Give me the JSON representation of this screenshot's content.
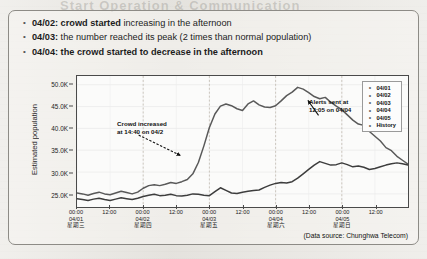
{
  "ghost_text": "Start Operation & Communication",
  "bullets": [
    {
      "marker": "•",
      "bold_part": "04/02: crowd started ",
      "normal_part": "increasing in the afternoon"
    },
    {
      "marker": "•",
      "bold_part": "04/03: ",
      "normal_part": " the number reached its peak (2 times than normal population)"
    },
    {
      "marker": "•",
      "bold_part": "04/04: the crowd started to decrease in the afternoon",
      "normal_part": ""
    }
  ],
  "source_note": "(Data source: Chunghwa Telecom)",
  "annotations": {
    "left": {
      "line1": "Crowd increased",
      "line2": "at 14:40 on 04/2"
    },
    "right": {
      "line1": "Alerts sent at",
      "line2": "12:05 on 04/04"
    }
  },
  "legend": {
    "marker": "•",
    "items": [
      "04/01",
      "04/02",
      "04/03",
      "04/04",
      "04/05",
      "History"
    ]
  },
  "chart_data": {
    "type": "line",
    "title": "",
    "xlabel": "",
    "ylabel": "Estimated population",
    "ylim": [
      22000,
      52000
    ],
    "ytick_values": [
      25000,
      30000,
      35000,
      40000,
      45000,
      50000
    ],
    "ytick_labels": [
      "25.0K",
      "30.0K",
      "35.0K",
      "40.0K",
      "45.0K",
      "50.0K"
    ],
    "grid": true,
    "legend_position": "top-right-inside",
    "xtick_labels": [
      {
        "time": "00:00",
        "date": "04/01",
        "weekday": "星期三"
      },
      {
        "time": "12:00",
        "date": "",
        "weekday": ""
      },
      {
        "time": "00:00",
        "date": "04/02",
        "weekday": "星期四"
      },
      {
        "time": "12:00",
        "date": "",
        "weekday": ""
      },
      {
        "time": "00:00",
        "date": "04/03",
        "weekday": "星期五"
      },
      {
        "time": "12:00",
        "date": "",
        "weekday": ""
      },
      {
        "time": "00:00",
        "date": "04/04",
        "weekday": "星期六"
      },
      {
        "time": "12:00",
        "date": "",
        "weekday": ""
      },
      {
        "time": "00:00",
        "date": "04/05",
        "weekday": "星期日"
      },
      {
        "time": "12:00",
        "date": "",
        "weekday": ""
      }
    ],
    "x_hours": [
      0,
      12,
      24,
      36,
      48,
      60,
      72,
      84,
      96,
      108
    ],
    "x_range_hours": [
      0,
      120
    ],
    "series": [
      {
        "name": "Current",
        "color": "#595959",
        "x": [
          0,
          2,
          4,
          6,
          8,
          10,
          12,
          14,
          16,
          18,
          20,
          22,
          24,
          26,
          28,
          30,
          32,
          34,
          36,
          38,
          40,
          42,
          44,
          46,
          48,
          50,
          52,
          54,
          56,
          58,
          60,
          62,
          64,
          66,
          68,
          70,
          72,
          74,
          76,
          78,
          80,
          82,
          84,
          86,
          88,
          90,
          92,
          94,
          96,
          98,
          100,
          102,
          104,
          106,
          108,
          110,
          112,
          114,
          116,
          118,
          120
        ],
        "values": [
          25200,
          25000,
          24700,
          25100,
          25400,
          25000,
          24800,
          25200,
          25600,
          25300,
          25000,
          25400,
          26300,
          26900,
          27100,
          26900,
          27200,
          27600,
          27400,
          27800,
          28300,
          29600,
          32200,
          36000,
          40200,
          43300,
          45100,
          45600,
          45200,
          44500,
          44100,
          45600,
          46300,
          45400,
          44900,
          44800,
          45200,
          46300,
          47500,
          48300,
          49400,
          49000,
          48200,
          47300,
          46800,
          47100,
          46000,
          45100,
          44300,
          43100,
          41900,
          41000,
          40700,
          39300,
          38200,
          37100,
          35600,
          34900,
          33600,
          32700,
          31800
        ]
      },
      {
        "name": "History",
        "color": "#3d3d3d",
        "x": [
          0,
          2,
          4,
          6,
          8,
          10,
          12,
          14,
          16,
          18,
          20,
          22,
          24,
          26,
          28,
          30,
          32,
          34,
          36,
          38,
          40,
          42,
          44,
          46,
          48,
          50,
          52,
          54,
          56,
          58,
          60,
          62,
          64,
          66,
          68,
          70,
          72,
          74,
          76,
          78,
          80,
          82,
          84,
          86,
          88,
          90,
          92,
          94,
          96,
          98,
          100,
          102,
          104,
          106,
          108,
          110,
          112,
          114,
          116,
          118,
          120
        ],
        "values": [
          23900,
          23700,
          23500,
          23800,
          24000,
          23700,
          23500,
          23800,
          24100,
          23900,
          23700,
          24000,
          24400,
          24700,
          24900,
          24600,
          24700,
          24900,
          24600,
          24500,
          24700,
          25000,
          24900,
          24700,
          24600,
          25500,
          26400,
          25800,
          25200,
          25100,
          25400,
          25600,
          25800,
          25900,
          26500,
          27000,
          27400,
          27600,
          27500,
          27800,
          28600,
          29600,
          30600,
          31600,
          32400,
          32000,
          31600,
          31700,
          32100,
          31700,
          31200,
          31400,
          31100,
          30600,
          30800,
          31200,
          31600,
          31900,
          32100,
          31900,
          31600
        ]
      }
    ],
    "day_boundaries_hours": [
      24,
      48,
      72,
      96
    ],
    "event_markers": [
      {
        "label": "Crowd increased at 14:40 on 04/2",
        "x_hour": 38.6
      },
      {
        "label": "Alerts sent at 12:05 on 04/04",
        "x_hour": 84.1
      }
    ]
  }
}
